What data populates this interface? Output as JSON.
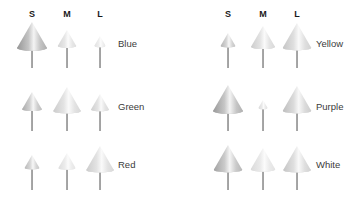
{
  "figure": {
    "background": "#ffffff",
    "glyph_type": "3D cone marker with stem",
    "column_headers": [
      "S",
      "M",
      "L"
    ]
  },
  "chart_data": {
    "type": "heatmap",
    "title": "",
    "xlabel": "",
    "ylabel": "",
    "categories": [
      "S",
      "M",
      "L"
    ],
    "legend_position": "right",
    "grid": false,
    "encoding": "cone size and shading encode magnitude per row/column cell",
    "panels": [
      {
        "name": "left",
        "rows": [
          {
            "label": "Blue",
            "cells": [
              {
                "column": "S",
                "size": 1.0,
                "shade": 0.62
              },
              {
                "column": "M",
                "size": 0.62,
                "shade": 0.25
              },
              {
                "column": "L",
                "size": 0.38,
                "shade": 0.18
              }
            ]
          },
          {
            "label": "Green",
            "cells": [
              {
                "column": "S",
                "size": 0.66,
                "shade": 0.5
              },
              {
                "column": "M",
                "size": 0.92,
                "shade": 0.3
              },
              {
                "column": "L",
                "size": 0.6,
                "shade": 0.28
              }
            ]
          },
          {
            "label": "Red",
            "cells": [
              {
                "column": "S",
                "size": 0.5,
                "shade": 0.42
              },
              {
                "column": "M",
                "size": 0.58,
                "shade": 0.2
              },
              {
                "column": "L",
                "size": 0.92,
                "shade": 0.3
              }
            ]
          }
        ]
      },
      {
        "name": "right",
        "rows": [
          {
            "label": "Yellow",
            "cells": [
              {
                "column": "S",
                "size": 0.5,
                "shade": 0.45
              },
              {
                "column": "M",
                "size": 0.8,
                "shade": 0.3
              },
              {
                "column": "L",
                "size": 0.95,
                "shade": 0.34
              }
            ]
          },
          {
            "label": "Purple",
            "cells": [
              {
                "column": "S",
                "size": 1.0,
                "shade": 0.6
              },
              {
                "column": "M",
                "size": 0.3,
                "shade": 0.22
              },
              {
                "column": "L",
                "size": 0.95,
                "shade": 0.38
              }
            ]
          },
          {
            "label": "White",
            "cells": [
              {
                "column": "S",
                "size": 0.95,
                "shade": 0.55
              },
              {
                "column": "M",
                "size": 0.82,
                "shade": 0.22
              },
              {
                "column": "L",
                "size": 0.92,
                "shade": 0.34
              }
            ]
          }
        ]
      }
    ]
  }
}
